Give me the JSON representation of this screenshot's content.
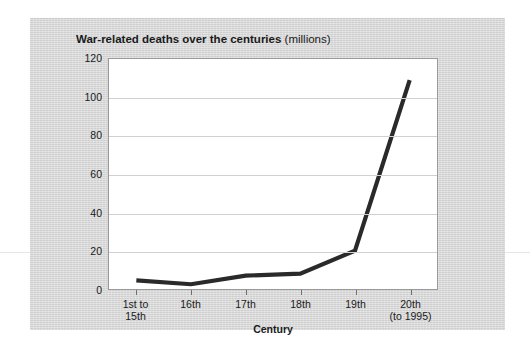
{
  "chart_data": {
    "type": "line",
    "title": "War-related deaths over the centuries",
    "title_unit": "(millions)",
    "xlabel": "Century",
    "ylabel": "",
    "ylim": [
      0,
      120
    ],
    "yticks": [
      0,
      20,
      40,
      60,
      80,
      100,
      120
    ],
    "grid": true,
    "legend": "none",
    "categories": [
      "1st to\n15th",
      "16th",
      "17th",
      "18th",
      "19th",
      "20th\n(to 1995)"
    ],
    "values": [
      4.5,
      2.5,
      7,
      8,
      20,
      109
    ],
    "series": [
      {
        "name": "War-related deaths",
        "values": [
          4.5,
          2.5,
          7,
          8,
          20,
          109
        ],
        "color": "#2a2a2a"
      }
    ]
  },
  "style": {
    "card_background": "#d6d6d6",
    "plot_background": "#ffffff",
    "gridline_color": "#d0d0d0",
    "axis_color": "#9a9a9a",
    "line_color": "#2a2a2a",
    "text_color": "#1a1a1a"
  }
}
